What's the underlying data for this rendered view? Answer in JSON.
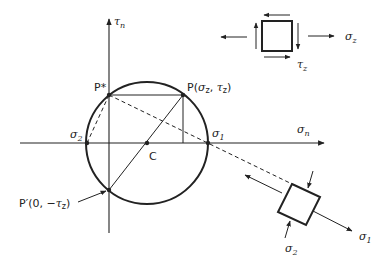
{
  "diagram": {
    "axes": {
      "horizontal": {
        "label": "σ",
        "sub": "n"
      },
      "vertical": {
        "label": "τ",
        "sub": "n"
      }
    },
    "points": {
      "pole": {
        "label": "P*"
      },
      "P": {
        "label_prefix": "P(",
        "sigma": "σ",
        "sigma_sub": "z",
        "comma": ", ",
        "tau": "τ",
        "tau_sub": "z",
        "label_suffix": ")"
      },
      "P_prime": {
        "label_prefix": "P′(0, −",
        "tau": "τ",
        "tau_sub": "z",
        "label_suffix": ")"
      },
      "center": {
        "label": "C"
      },
      "sigma1": {
        "label": "σ",
        "sub": "1"
      },
      "sigma2": {
        "label": "σ",
        "sub": "2"
      }
    },
    "element_top": {
      "sigma_label": "σ",
      "sigma_sub": "z",
      "tau_label": "τ",
      "tau_sub": "z"
    },
    "element_rotated": {
      "sigma1_label": "σ",
      "sigma1_sub": "1",
      "sigma2_label": "σ",
      "sigma2_sub": "2"
    },
    "colors": {
      "ink": "#222222",
      "background": "#ffffff"
    }
  }
}
